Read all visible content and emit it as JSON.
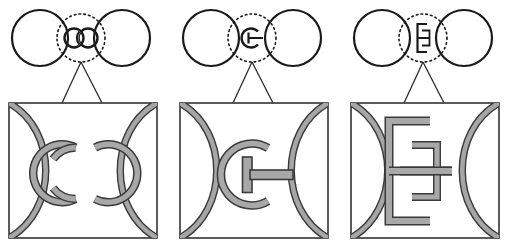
{
  "figure": {
    "title": "",
    "canvas": {
      "width": 513,
      "height": 252,
      "background": "#ffffff"
    },
    "colors": {
      "outline": "#1a1a1a",
      "band_fill": "#9a9a9a",
      "band_fill_light": "#b5b5b5",
      "band_outline": "#3a3a3a",
      "box_stroke": "#333333",
      "dotted_circle": "#1a1a1a",
      "callout_line": "#2b2b2b",
      "background": "#ffffff"
    },
    "panels": [
      {
        "id": "panel-1",
        "index": 1,
        "label": "",
        "top_view": {
          "name": "two-touching-circles",
          "left_circle": {
            "cx": 40,
            "cy": 38,
            "r": 28
          },
          "right_circle": {
            "cx": 122,
            "cy": 38,
            "r": 28
          },
          "dotted_marker": {
            "cx": 81,
            "cy": 38,
            "r": 24,
            "style": "dotted"
          },
          "junction_glyph": "two-interlocking-rings"
        },
        "callout": {
          "apex": {
            "x": 81,
            "y": 62
          },
          "left_foot": {
            "x": 62,
            "y": 103
          },
          "right_foot": {
            "x": 102,
            "y": 103
          }
        },
        "magnified_box": {
          "x": 9,
          "y": 103,
          "width": 148,
          "height": 135
        },
        "magnified_glyph": "two-interlocking-open-rings",
        "magnified_description": "Two overlapping C-shaped open ring bands interlock between the two large circle arcs."
      },
      {
        "id": "panel-2",
        "index": 2,
        "label": "",
        "top_view": {
          "name": "two-touching-circles",
          "left_circle": {
            "cx": 211,
            "cy": 38,
            "r": 28
          },
          "right_circle": {
            "cx": 293,
            "cy": 38,
            "r": 28
          },
          "dotted_marker": {
            "cx": 252,
            "cy": 38,
            "r": 24,
            "style": "dotted"
          },
          "junction_glyph": "c-ring-with-bar"
        },
        "callout": {
          "apex": {
            "x": 252,
            "y": 62
          },
          "left_foot": {
            "x": 233,
            "y": 103
          },
          "right_foot": {
            "x": 273,
            "y": 103
          }
        },
        "magnified_box": {
          "x": 180,
          "y": 103,
          "width": 148,
          "height": 135
        },
        "magnified_glyph": "c-ring-with-t-bar",
        "magnified_description": "A single C-shaped open ring band with a T-shaped bar whose stem bridges rightwards to the right circle arc."
      },
      {
        "id": "panel-3",
        "index": 3,
        "label": "",
        "top_view": {
          "name": "two-touching-circles",
          "left_circle": {
            "cx": 382,
            "cy": 38,
            "r": 28
          },
          "right_circle": {
            "cx": 464,
            "cy": 38,
            "r": 28
          },
          "dotted_marker": {
            "cx": 423,
            "cy": 38,
            "r": 24,
            "style": "dotted"
          },
          "junction_glyph": "h-beam-bracket"
        },
        "callout": {
          "apex": {
            "x": 423,
            "y": 62
          },
          "left_foot": {
            "x": 404,
            "y": 103
          },
          "right_foot": {
            "x": 444,
            "y": 103
          }
        },
        "magnified_box": {
          "x": 351,
          "y": 103,
          "width": 148,
          "height": 135
        },
        "magnified_glyph": "h-beam-bracket",
        "magnified_description": "An H / I-beam bracket band: a tall left bracket opening right, joined by a horizontal bar to the right circle arc."
      }
    ]
  }
}
